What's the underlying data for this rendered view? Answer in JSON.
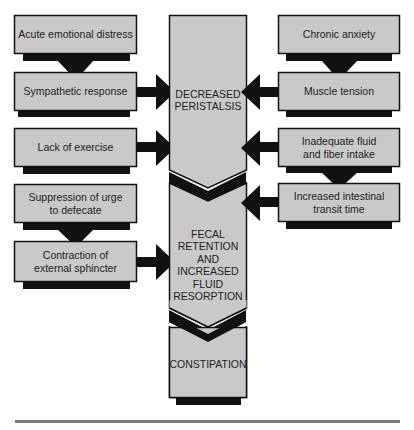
{
  "colors": {
    "box_fill": "#c9c9c9",
    "box_border": "#111111",
    "shadow": "#111111",
    "arrow": "#111111",
    "rule": "#7a7a7a",
    "background": "#ffffff"
  },
  "left_column": [
    {
      "id": "acute-emotional-distress",
      "label": "Acute emotional distress"
    },
    {
      "id": "sympathetic-response",
      "label": "Sympathetic response"
    },
    {
      "id": "lack-of-exercise",
      "label": "Lack of exercise"
    },
    {
      "id": "suppression-of-urge",
      "label": "Suppression of urge to defecate",
      "line1": "Suppression of urge",
      "line2": "to defecate"
    },
    {
      "id": "contraction-external-sphincter",
      "label": "Contraction of external sphincter",
      "line1": "Contraction of",
      "line2": "external sphincter"
    }
  ],
  "right_column": [
    {
      "id": "chronic-anxiety",
      "label": "Chronic anxiety"
    },
    {
      "id": "muscle-tension",
      "label": "Muscle tension"
    },
    {
      "id": "inadequate-fluid-fiber",
      "label": "Inadequate fluid and fiber intake",
      "line1": "Inadequate fluid",
      "line2": "and fiber intake"
    },
    {
      "id": "increased-transit-time",
      "label": "Increased intestinal transit time",
      "line1": "Increased intestinal",
      "line2": "transit time"
    }
  ],
  "center_column": [
    {
      "id": "decreased-peristalsis",
      "line1": "DECREASED",
      "line2": "PERISTALSIS"
    },
    {
      "id": "fecal-retention",
      "lines": [
        "FECAL",
        "RETENTION",
        "AND",
        "INCREASED",
        "FLUID",
        "RESORPTION"
      ]
    },
    {
      "id": "constipation",
      "line1": "CONSTIPATION"
    }
  ],
  "connections": [
    {
      "from": "Acute emotional distress",
      "to": "Sympathetic response"
    },
    {
      "from": "Sympathetic response",
      "to": "DECREASED PERISTALSIS"
    },
    {
      "from": "Lack of exercise",
      "to": "DECREASED PERISTALSIS"
    },
    {
      "from": "Chronic anxiety",
      "to": "Muscle tension"
    },
    {
      "from": "Muscle tension",
      "to": "DECREASED PERISTALSIS"
    },
    {
      "from": "Inadequate fluid and fiber intake",
      "to": "DECREASED PERISTALSIS"
    },
    {
      "from": "Inadequate fluid and fiber intake",
      "to": "Increased intestinal transit time"
    },
    {
      "from": "Increased intestinal transit time",
      "to": "FECAL RETENTION AND INCREASED FLUID RESORPTION"
    },
    {
      "from": "Suppression of urge to defecate",
      "to": "Contraction of external sphincter"
    },
    {
      "from": "Contraction of external sphincter",
      "to": "FECAL RETENTION AND INCREASED FLUID RESORPTION"
    },
    {
      "from": "DECREASED PERISTALSIS",
      "to": "FECAL RETENTION AND INCREASED FLUID RESORPTION"
    },
    {
      "from": "FECAL RETENTION AND INCREASED FLUID RESORPTION",
      "to": "CONSTIPATION"
    }
  ]
}
